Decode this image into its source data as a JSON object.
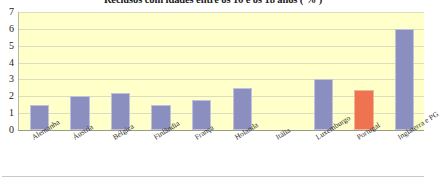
{
  "chart_data": {
    "type": "bar",
    "title": "Reclusos com idades entre os 16 e os 18 anos ( % )",
    "xlabel": "",
    "ylabel": "",
    "ylim": [
      0,
      7
    ],
    "yticks": [
      0,
      1,
      2,
      3,
      4,
      5,
      6,
      7
    ],
    "ytick_labels": [
      "0",
      "1",
      "2",
      "3",
      "4",
      "5",
      "6",
      "7"
    ],
    "grid": true,
    "legend": false,
    "categories": [
      "Alemanha",
      "Áustria",
      "Bélgica",
      "Finlândia",
      "França",
      "Holanda",
      "Itália",
      "Luxemburgo",
      "Portugal",
      "Inglaterra e PG"
    ],
    "values": [
      1.5,
      2.0,
      2.2,
      1.5,
      1.8,
      2.5,
      0,
      3.0,
      2.4,
      6.0
    ],
    "highlight_category": "Portugal",
    "colors": {
      "bar": "#8b8fc0",
      "bar_border": "#bfc2dd",
      "highlight_bar": "#ef7351",
      "highlight_border": "#f3b49a",
      "plot_background": "#feffc9",
      "gridline": "#dcdcbe",
      "axis": "#9a9a86",
      "text": "#1a1a1a"
    }
  }
}
